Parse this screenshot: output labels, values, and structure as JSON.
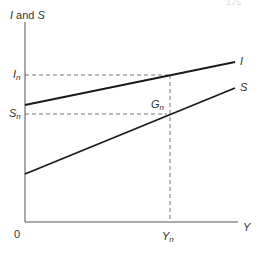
{
  "header": {
    "page_fragment": "175"
  },
  "diagram": {
    "y_axis_label": {
      "main": "I",
      "connector": " and ",
      "second": "S"
    },
    "x_axis_label": "Y",
    "origin_label": "0",
    "curves": [
      {
        "name": "I",
        "label": "I",
        "from": [
          25,
          105
        ],
        "to": [
          235,
          62
        ]
      },
      {
        "name": "S",
        "label": "S",
        "from": [
          25,
          174
        ],
        "to": [
          235,
          88
        ]
      }
    ],
    "markers": {
      "I_n": {
        "base": "I",
        "sub": "n"
      },
      "S_n": {
        "base": "S",
        "sub": "n"
      },
      "Y_n": {
        "base": "Y",
        "sub": "n"
      },
      "G_n": {
        "base": "G",
        "sub": "n"
      }
    },
    "colors": {
      "line": "#1a1a1a",
      "axis": "#555555",
      "dash": "#555555"
    }
  }
}
